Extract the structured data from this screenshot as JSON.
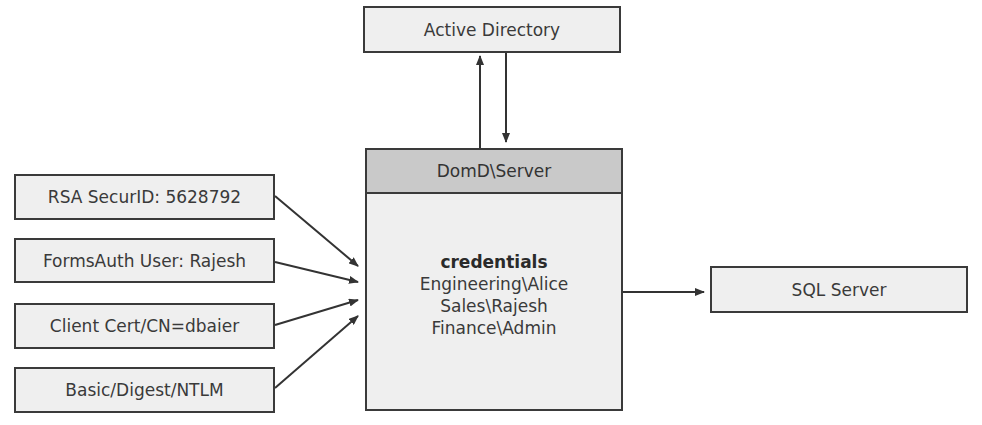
{
  "diagram": {
    "active_directory": {
      "label": "Active Directory"
    },
    "server": {
      "header": "DomD\\Server",
      "title": "credentials",
      "entries": [
        "Engineering\\Alice",
        "Sales\\Rajesh",
        "Finance\\Admin"
      ]
    },
    "sql_server": {
      "label": "SQL Server"
    },
    "clients": [
      {
        "label": "RSA SecurID: 5628792"
      },
      {
        "label": "FormsAuth User: Rajesh"
      },
      {
        "label": "Client Cert/CN=dbaier"
      },
      {
        "label": "Basic/Digest/NTLM"
      }
    ],
    "colors": {
      "box_fill": "#efefef",
      "header_fill": "#c9c9c9",
      "border": "#3a3a3a",
      "arrow": "#333333"
    }
  }
}
